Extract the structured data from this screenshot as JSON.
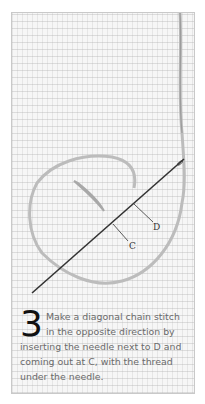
{
  "illustration": {
    "labels": {
      "d": "D",
      "c": "C"
    },
    "icon": "needle-and-thread-chain-stitch"
  },
  "caption": {
    "step_number": "3",
    "text": "Make a diagonal chain stitch in the opposite direction by inserting the needle next to D and coming out at C, with the thread under the needle."
  }
}
